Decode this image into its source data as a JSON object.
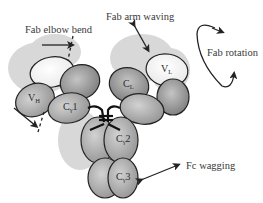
{
  "diagram": {
    "motions": {
      "fab_elbow_bend": "Fab elbow bend",
      "fab_arm_waving": "Fab arm waving",
      "fab_rotation": "Fab rotation",
      "fc_wagging": "Fc wagging"
    },
    "domains": {
      "vh": {
        "main": "V",
        "sub": "H"
      },
      "cg1": {
        "main": "C",
        "sub": "γ",
        "suffix": "1"
      },
      "vl": {
        "main": "V",
        "sub": "L"
      },
      "cl": {
        "main": "C",
        "sub": "L"
      },
      "cg2": {
        "main": "C",
        "sub": "γ",
        "suffix": "2"
      },
      "cg3": {
        "main": "C",
        "sub": "γ",
        "suffix": "3"
      }
    },
    "colors": {
      "domain_dark": "#8a8a8a",
      "domain_mid": "#a8a8a8",
      "domain_light": "#f2f2f2",
      "shadow": "#d6d6d6",
      "outline": "#222222",
      "text": "#3a3a3a"
    }
  }
}
